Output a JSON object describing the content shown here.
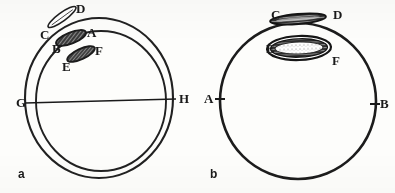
{
  "figure": {
    "background_color": "#fdfdfb",
    "ink_color": "#1f1f1f",
    "panels": [
      {
        "id": "a",
        "caption": "a",
        "description": "two concentric circles with a horizontal chord line and three elongated oval bodies near the upper left",
        "shapes": [
          {
            "name": "outer-circle",
            "type": "circle"
          },
          {
            "name": "inner-circle",
            "type": "circle"
          },
          {
            "name": "chord-line-gh",
            "type": "line"
          },
          {
            "name": "oval-cd",
            "type": "elongated-oval-outline"
          },
          {
            "name": "oval-ba",
            "type": "filled-hatched-oval"
          },
          {
            "name": "oval-ef",
            "type": "filled-hatched-oval"
          }
        ],
        "labels": [
          {
            "text": "C",
            "name": "label-c"
          },
          {
            "text": "D",
            "name": "label-d"
          },
          {
            "text": "B",
            "name": "label-b"
          },
          {
            "text": "A",
            "name": "label-a"
          },
          {
            "text": "E",
            "name": "label-e"
          },
          {
            "text": "F",
            "name": "label-f"
          },
          {
            "text": "G",
            "name": "label-g"
          },
          {
            "text": "H",
            "name": "label-h"
          }
        ]
      },
      {
        "id": "b",
        "caption": "b",
        "description": "a single thick circle with two elongated oval bodies near the top and tick marks at left and right",
        "shapes": [
          {
            "name": "outer-circle",
            "type": "circle"
          },
          {
            "name": "oval-cd",
            "type": "elongated-spindle"
          },
          {
            "name": "oval-ef",
            "type": "large-hatched-ellipse"
          },
          {
            "name": "tick-left",
            "type": "tick"
          },
          {
            "name": "tick-right",
            "type": "tick"
          }
        ],
        "labels": [
          {
            "text": "C",
            "name": "label-c"
          },
          {
            "text": "D",
            "name": "label-d"
          },
          {
            "text": "E",
            "name": "label-e"
          },
          {
            "text": "F",
            "name": "label-f"
          },
          {
            "text": "A",
            "name": "label-a"
          },
          {
            "text": "B",
            "name": "label-b"
          }
        ]
      }
    ]
  }
}
